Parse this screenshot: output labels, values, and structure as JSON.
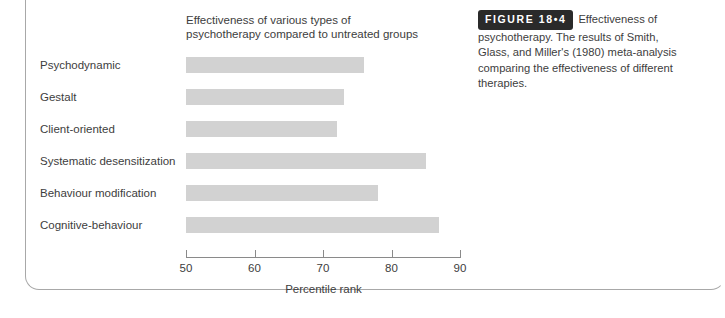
{
  "figure": {
    "badge_label": "FIGURE 18•4",
    "caption": "Effectiveness of psychotherapy. The results of Smith, Glass, and Miller's (1980) meta-analysis comparing the effectiveness of different therapies."
  },
  "colors": {
    "bar": "#d2d2d2",
    "axis": "#8a8a8a",
    "text": "#3d3d3d",
    "badge_background": "#2a2a2a",
    "badge_text": "#ffffff",
    "frame": "#a8a8a8",
    "page_background": "#ffffff"
  },
  "chart_data": {
    "type": "bar",
    "orientation": "horizontal",
    "title": "Effectiveness of various types of\npsychotherapy compared to untreated groups",
    "xlabel": "Percentile rank",
    "ylabel": "",
    "xlim": [
      50,
      90
    ],
    "xticks": [
      50,
      60,
      70,
      80,
      90
    ],
    "xtick_labels": [
      "50",
      "60",
      "70",
      "80",
      "90"
    ],
    "grid": false,
    "legend": false,
    "categories": [
      "Psychodynamic",
      "Gestalt",
      "Client-oriented",
      "Systematic desensitization",
      "Behaviour modification",
      "Cognitive-behaviour"
    ],
    "values": [
      76,
      73,
      72,
      85,
      78,
      87
    ]
  }
}
